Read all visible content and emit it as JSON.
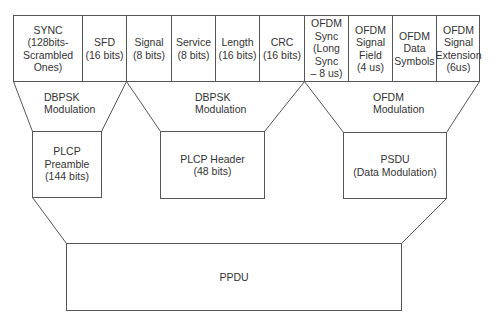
{
  "diagram": {
    "top_row": [
      {
        "id": "sync",
        "lines": [
          "SYNC",
          "(128bits-",
          "Scrambled",
          "Ones)"
        ]
      },
      {
        "id": "sfd",
        "lines": [
          "SFD",
          "(16 bits)"
        ]
      },
      {
        "id": "signal",
        "lines": [
          "Signal",
          "(8 bits)"
        ]
      },
      {
        "id": "service",
        "lines": [
          "Service",
          "(8 bits)"
        ]
      },
      {
        "id": "length",
        "lines": [
          "Length",
          "(16 bits)"
        ]
      },
      {
        "id": "crc",
        "lines": [
          "CRC",
          "(16 bits)"
        ]
      },
      {
        "id": "ofdm-sync",
        "lines": [
          "OFDM",
          "Sync",
          "(Long",
          "Sync",
          "– 8 us)"
        ]
      },
      {
        "id": "ofdm-signal-field",
        "lines": [
          "OFDM",
          "Signal",
          "Field",
          "(4 us)"
        ]
      },
      {
        "id": "ofdm-data-symbols",
        "lines": [
          "OFDM",
          "Data",
          "Symbols"
        ]
      },
      {
        "id": "ofdm-signal-extension",
        "lines": [
          "OFDM",
          "Signal",
          "Extension",
          "(6us)"
        ]
      }
    ],
    "modulations": [
      {
        "id": "mod-preamble",
        "lines": [
          "DBPSK",
          "Modulation"
        ]
      },
      {
        "id": "mod-header",
        "lines": [
          "DBPSK",
          "Modulation"
        ]
      },
      {
        "id": "mod-psdu",
        "lines": [
          "OFDM",
          "Modulation"
        ]
      }
    ],
    "middle_row": [
      {
        "id": "plcp-preamble",
        "lines": [
          "PLCP",
          "Preamble",
          "(144 bits)"
        ]
      },
      {
        "id": "plcp-header",
        "lines": [
          "PLCP Header",
          "(48 bits)"
        ]
      },
      {
        "id": "psdu",
        "lines": [
          "PSDU",
          "(Data Modulation)"
        ]
      }
    ],
    "bottom": {
      "id": "ppdu",
      "label": "PPDU"
    },
    "colors": {
      "stroke": "#555555",
      "text": "#333333",
      "background": "#ffffff"
    }
  }
}
